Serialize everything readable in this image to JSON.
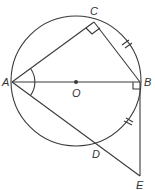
{
  "diagram": {
    "type": "geometry",
    "colors": {
      "stroke": "#3a3a3a",
      "label": "#333333",
      "background": "#ffffff"
    },
    "circle": {
      "center": "O",
      "cx": 76,
      "cy": 81,
      "r": 65
    },
    "points": {
      "A": {
        "label": "A",
        "x": 12,
        "y": 82
      },
      "B": {
        "label": "B",
        "x": 140,
        "y": 82
      },
      "O": {
        "label": "O",
        "x": 76,
        "y": 82
      },
      "C": {
        "label": "C",
        "x": 94,
        "y": 22
      },
      "D": {
        "label": "D",
        "x": 98,
        "y": 145
      },
      "E": {
        "label": "E",
        "x": 140,
        "y": 176
      }
    },
    "segments": [
      "AC",
      "CB",
      "AB",
      "AE",
      "BE"
    ],
    "marks": {
      "right_angles": [
        "C",
        "B"
      ],
      "equal_ticks": [
        "CB",
        "BD-arc-side (BE segment near circle)"
      ],
      "angle_arc": "A (angle CAE)"
    }
  }
}
